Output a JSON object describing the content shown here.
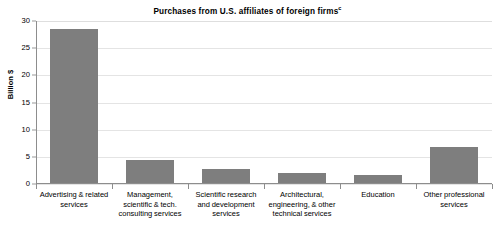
{
  "chart_data": {
    "type": "bar",
    "title": "Purchases from U.S. affiliates of foreign firms",
    "title_superscript": "c",
    "xlabel": "",
    "ylabel": "Billion $",
    "ylim": [
      0,
      30
    ],
    "ytick_step": 5,
    "yticks": [
      "30",
      "25",
      "20",
      "15",
      "10",
      "5",
      "0"
    ],
    "grid": true,
    "legend": "none",
    "bar_color": "#7e7e7e",
    "gridline_color": "#e4e4e4",
    "axis_color": "#8d8d8d",
    "categories": [
      "Advertising & related services",
      "Management, scientific & tech. consulting services",
      "Scientific research and development services",
      "Architectural, engineering, & other technical services",
      "Education",
      "Other professional services"
    ],
    "values": [
      28.5,
      4.5,
      2.8,
      2.0,
      1.7,
      6.8
    ]
  },
  "chart": {
    "title_text": "Purchases from U.S. affiliates of foreign firms",
    "title_sup": "c",
    "axis_title_y": "Billion $"
  }
}
